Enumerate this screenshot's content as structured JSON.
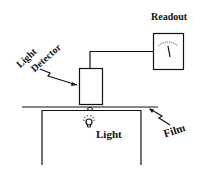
{
  "diagram": {
    "labels": {
      "readout": "Readout",
      "light_detector_line1": "Light",
      "light_detector_line2": "Detector",
      "light": "Light",
      "film": "Film"
    },
    "components": [
      "readout-meter",
      "light-detector",
      "film",
      "light-bulb",
      "stand"
    ],
    "colors": {
      "ink": "#111111",
      "background": "#ffffff"
    }
  }
}
